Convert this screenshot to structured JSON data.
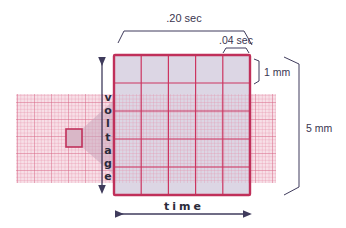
{
  "diagram": {
    "labels": {
      "big_box_time": ".20 sec",
      "small_box_time": ".04 sec",
      "small_box_voltage": "1 mm",
      "big_box_voltage": "5 mm",
      "x_axis": "time",
      "y_axis": "voltage"
    },
    "y_axis_letters": [
      "v",
      "o",
      "l",
      "t",
      "a",
      "g",
      "e"
    ],
    "x_axis_letters": [
      "t",
      "i",
      "m",
      "e"
    ],
    "grid": {
      "large_boxes_per_side": 5,
      "small_boxes_per_large": 5
    },
    "colors": {
      "grid_major": "#cc3560",
      "grid_minor": "#e58aa5",
      "grid_fill": "#dcd6e4",
      "strip_fill": "#f7dfe7",
      "annotation": "#3f3b5c"
    }
  }
}
